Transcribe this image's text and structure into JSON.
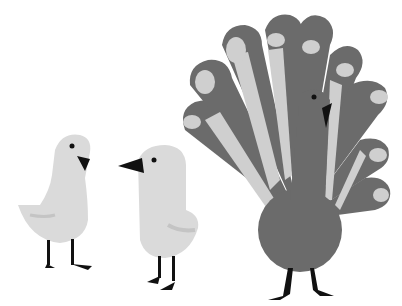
{
  "scene": {
    "description": "Grayscale illustration of two white chicks facing each other next to a peacock with its tail fanned",
    "colors": {
      "background": "#ffffff",
      "peacock_body": "#6b6b6b",
      "peacock_eyespots": "#cfcfcf",
      "chick_body": "#dadada",
      "chick_wing": "#c4c4c4",
      "beak_legs": "#111111"
    },
    "subjects": [
      "chick-left",
      "chick-right",
      "peacock"
    ]
  }
}
